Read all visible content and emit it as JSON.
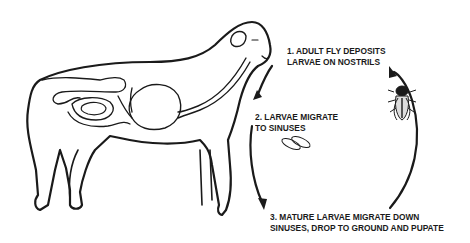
{
  "diagram": {
    "steps": [
      {
        "number": "1.",
        "lines": [
          "1. ADULT FLY DEPOSITS",
          "LARVAE ON NOSTRILS"
        ]
      },
      {
        "number": "2.",
        "lines": [
          "2. LARVAE MIGRATE",
          "TO SINUSES"
        ]
      },
      {
        "number": "3.",
        "lines": [
          "3. MATURE LARVAE MIGRATE DOWN",
          "SINUSES, DROP TO GROUND AND PUPATE"
        ]
      }
    ],
    "icons": [
      "sheep-illustration",
      "larvae-icon",
      "adult-fly-icon",
      "cycle-arrow-icon"
    ],
    "colors": {
      "ink": "#1a1a1a",
      "background": "#ffffff"
    }
  }
}
